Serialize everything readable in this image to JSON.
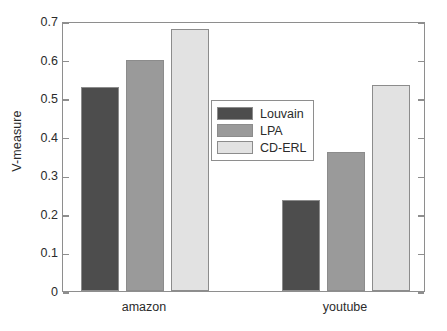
{
  "chart_data": {
    "type": "bar",
    "title": "",
    "xlabel": "",
    "ylabel": "V-measure",
    "categories": [
      "amazon",
      "youtube"
    ],
    "series": [
      {
        "name": "Louvain",
        "values": [
          0.53,
          0.235
        ],
        "color": "#4d4d4d"
      },
      {
        "name": "LPA",
        "values": [
          0.6,
          0.36
        ],
        "color": "#9a9a9a"
      },
      {
        "name": "CD-ERL",
        "values": [
          0.68,
          0.535
        ],
        "color": "#e2e2e2"
      }
    ],
    "ylim": [
      0,
      0.7
    ],
    "yticks": [
      0,
      0.1,
      0.2,
      0.3,
      0.4,
      0.5,
      0.6,
      0.7
    ],
    "ytick_labels": [
      "0",
      "0.1",
      "0.2",
      "0.3",
      "0.4",
      "0.5",
      "0.6",
      "0.7"
    ],
    "grid": false,
    "legend_position": "center",
    "axis_color": "#8e8e8e",
    "text_color": "#2b2b2b",
    "background": "#ffffff"
  },
  "legend": {
    "items": [
      {
        "label": "Louvain",
        "color": "#4d4d4d"
      },
      {
        "label": "LPA",
        "color": "#9a9a9a"
      },
      {
        "label": "CD-ERL",
        "color": "#e2e2e2"
      }
    ]
  }
}
